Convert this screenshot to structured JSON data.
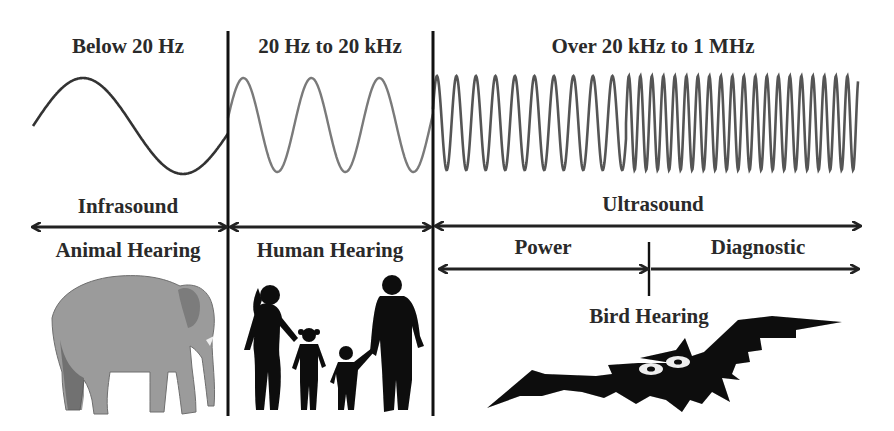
{
  "diagram": {
    "colors": {
      "background": "#ffffff",
      "text": "#2a2a2a",
      "divider": "#111111",
      "wave_infra": "#333333",
      "wave_human": "#777777",
      "wave_ultra": "#555555",
      "silhouette": "#0a0a0a",
      "elephant": "#9a9a9a"
    },
    "bands": [
      {
        "id": "infrasound",
        "range_label": "Below 20 Hz",
        "name": "Infrasound",
        "hearing": "Animal Hearing",
        "illustration": "elephant"
      },
      {
        "id": "audible",
        "range_label": "20 Hz to 20 kHz",
        "name": "",
        "hearing": "Human Hearing",
        "illustration": "family-silhouette"
      },
      {
        "id": "ultrasound",
        "range_label": "Over 20 kHz to 1 MHz",
        "name": "Ultrasound",
        "hearing": "Bird Hearing",
        "illustration": "bat-silhouette",
        "sub_bands": [
          {
            "id": "power",
            "label": "Power"
          },
          {
            "id": "diagnostic",
            "label": "Diagnostic"
          }
        ]
      }
    ]
  }
}
